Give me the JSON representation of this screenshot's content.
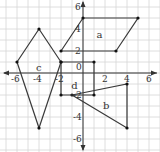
{
  "chart_data": {
    "type": "diagram-coordinate-plane",
    "title": "",
    "xlabel": "x",
    "ylabel": "y",
    "xlim": [
      -7,
      7
    ],
    "ylim": [
      -7,
      7
    ],
    "grid": true,
    "x_tick_labels": [
      "-6",
      "-4",
      "-2",
      "0",
      "2",
      "4",
      "6"
    ],
    "y_tick_labels": [
      "6",
      "4",
      "2",
      "-2",
      "-4",
      "-6"
    ],
    "shapes": [
      {
        "label": "a",
        "type": "parallelogram",
        "vertices": [
          [
            -2,
            2
          ],
          [
            0,
            5
          ],
          [
            5,
            5
          ],
          [
            3,
            2
          ]
        ],
        "label_pos": [
          1.5,
          3.5
        ]
      },
      {
        "label": "b",
        "type": "triangle",
        "vertices": [
          [
            -1,
            -2
          ],
          [
            4,
            -1
          ],
          [
            4,
            -5
          ]
        ],
        "label_pos": [
          2.1,
          -3.0
        ]
      },
      {
        "label": "c",
        "type": "kite",
        "vertices": [
          [
            -4,
            4
          ],
          [
            -2,
            1
          ],
          [
            -4,
            -5
          ],
          [
            -6,
            1
          ]
        ],
        "label_pos": [
          -4,
          0.5
        ]
      },
      {
        "label": "d",
        "type": "rectangle",
        "vertices": [
          [
            -2,
            1
          ],
          [
            1,
            1
          ],
          [
            1,
            -2
          ],
          [
            -2,
            -2
          ]
        ],
        "label_pos": [
          -0.8,
          -1.2
        ]
      }
    ]
  },
  "labels": {
    "origin": "0",
    "x_axis_arrow": "x",
    "y_axis_arrow": "y"
  }
}
